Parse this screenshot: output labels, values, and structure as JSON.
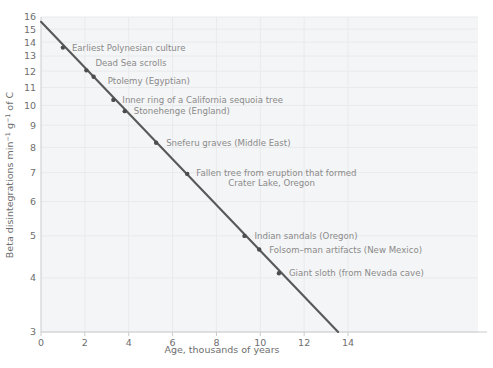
{
  "figure": {
    "background_color": "#ffffff",
    "plot_shade_color": "#f4f5f6",
    "gridline_color": "#e9eaec",
    "axis_color": "#c9cbcd",
    "line_color": "#595959",
    "marker_color": "#4d4d4d",
    "annotation_color": "#8a8a8a",
    "tick_color": "#6e6e6e"
  },
  "axes": {
    "x": {
      "title": "Age, thousands of years",
      "ticks": [
        "0",
        "2",
        "4",
        "6",
        "8",
        "10",
        "12",
        "14"
      ],
      "tick_values": [
        0,
        2,
        4,
        6,
        8,
        10,
        12,
        14
      ],
      "min": 0,
      "max": 14
    },
    "y": {
      "title_parts": {
        "a": "Beta disintegrations min",
        "sup1": "−1",
        "b": " g",
        "sup2": "−1",
        "c": " of C"
      },
      "title": "Beta disintegrations min−1 g−1 of C",
      "ticks": [
        "16",
        "15",
        "14",
        "13",
        "12",
        "11",
        "10",
        "9",
        "8",
        "7",
        "6",
        "5",
        "4",
        "3"
      ],
      "tick_values": [
        16,
        15,
        14,
        13,
        12,
        11,
        10,
        9,
        8,
        7,
        6,
        5,
        4,
        3
      ],
      "scale": "log",
      "min": 3,
      "max": 16
    }
  },
  "chart_data": {
    "type": "line",
    "title": "",
    "xlabel": "Age, thousands of years",
    "ylabel": "Beta disintegrations min−1 g−1 of C",
    "xlim": [
      0,
      14
    ],
    "ylim": [
      3,
      16
    ],
    "yscale": "log",
    "xscale": "linear",
    "grid": true,
    "legend": "none",
    "series": [
      {
        "name": "Radiocarbon decay curve",
        "line_from": {
          "x": 0,
          "y": 15.6
        },
        "line_to": {
          "x": 13.55,
          "y": 3.0
        },
        "x": [
          0,
          13.55
        ],
        "values": [
          15.6,
          3.0
        ]
      }
    ],
    "points": [
      {
        "label": "Earliest Polynesian culture",
        "x": 1.0,
        "y": 13.6,
        "label_lines": [
          "Earliest Polynesian culture"
        ]
      },
      {
        "label": "Dead Sea scrolls",
        "x": 2.07,
        "y": 12.05,
        "label_lines": [
          "Dead Sea scrolls"
        ]
      },
      {
        "label": "Ptolemy (Egyptian)",
        "x": 2.4,
        "y": 11.65,
        "label_lines": [
          "Ptolemy (Egyptian)"
        ]
      },
      {
        "label": "Inner ring of a California sequoia tree",
        "x": 3.3,
        "y": 10.3,
        "label_lines": [
          "Inner ring of a California sequoia tree"
        ]
      },
      {
        "label": "Stonehenge (England)",
        "x": 3.82,
        "y": 9.7,
        "label_lines": [
          "Stonehenge (England)"
        ]
      },
      {
        "label": "Sneferu graves (Middle East)",
        "x": 5.25,
        "y": 8.2,
        "label_lines": [
          "Sneferu graves (Middle East)"
        ]
      },
      {
        "label": "Fallen tree from eruption that formed Crater Lake, Oregon",
        "x": 6.67,
        "y": 6.95,
        "label_lines": [
          "Fallen tree from eruption that formed",
          "Crater Lake, Oregon"
        ]
      },
      {
        "label": "Indian sandals (Oregon)",
        "x": 9.28,
        "y": 5.0,
        "label_lines": [
          "Indian sandals (Oregon)"
        ]
      },
      {
        "label": "Folsom–man artifacts (New Mexico)",
        "x": 9.95,
        "y": 4.65,
        "label_lines": [
          "Folsom–man artifacts (New Mexico)"
        ]
      },
      {
        "label": "Giant sloth (from Nevada cave)",
        "x": 10.85,
        "y": 4.1,
        "label_lines": [
          "Giant sloth (from Nevada cave)"
        ]
      }
    ]
  }
}
